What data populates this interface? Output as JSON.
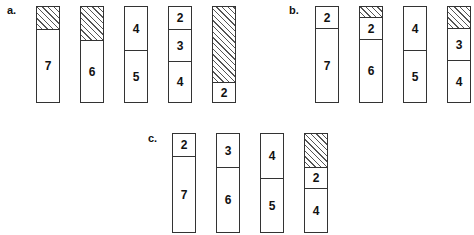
{
  "panels": [
    {
      "label": "a.",
      "label_pos": [
        7,
        5
      ],
      "bin_top": 6,
      "bin_height": 95,
      "bins": [
        {
          "x": 36,
          "segments": [
            {
              "type": "waste",
              "h": 22
            },
            {
              "type": "item",
              "value": "7",
              "h": 73
            }
          ]
        },
        {
          "x": 80,
          "segments": [
            {
              "type": "waste",
              "h": 33
            },
            {
              "type": "item",
              "value": "6",
              "h": 62
            }
          ]
        },
        {
          "x": 124,
          "segments": [
            {
              "type": "item",
              "value": "4",
              "h": 43
            },
            {
              "type": "item",
              "value": "5",
              "h": 52
            }
          ]
        },
        {
          "x": 168,
          "segments": [
            {
              "type": "item",
              "value": "2",
              "h": 22
            },
            {
              "type": "item",
              "value": "3",
              "h": 32
            },
            {
              "type": "item",
              "value": "4",
              "h": 41
            }
          ]
        },
        {
          "x": 212,
          "segments": [
            {
              "type": "waste",
              "h": 75
            },
            {
              "type": "item",
              "value": "2",
              "h": 20
            }
          ]
        }
      ]
    },
    {
      "label": "b.",
      "label_pos": [
        289,
        5
      ],
      "bin_top": 6,
      "bin_height": 95,
      "bins": [
        {
          "x": 315,
          "segments": [
            {
              "type": "item",
              "value": "2",
              "h": 21
            },
            {
              "type": "item",
              "value": "7",
              "h": 74
            }
          ]
        },
        {
          "x": 359,
          "segments": [
            {
              "type": "waste",
              "h": 10
            },
            {
              "type": "item",
              "value": "2",
              "h": 22
            },
            {
              "type": "item",
              "value": "6",
              "h": 63
            }
          ]
        },
        {
          "x": 403,
          "segments": [
            {
              "type": "item",
              "value": "4",
              "h": 43
            },
            {
              "type": "item",
              "value": "5",
              "h": 52
            }
          ]
        },
        {
          "x": 447,
          "segments": [
            {
              "type": "waste",
              "h": 21
            },
            {
              "type": "item",
              "value": "3",
              "h": 32
            },
            {
              "type": "item",
              "value": "4",
              "h": 42
            }
          ]
        }
      ]
    },
    {
      "label": "c.",
      "label_pos": [
        148,
        133
      ],
      "bin_top": 133,
      "bin_height": 98,
      "bins": [
        {
          "x": 172,
          "segments": [
            {
              "type": "item",
              "value": "2",
              "h": 22
            },
            {
              "type": "item",
              "value": "7",
              "h": 76
            }
          ]
        },
        {
          "x": 216,
          "segments": [
            {
              "type": "item",
              "value": "3",
              "h": 33
            },
            {
              "type": "item",
              "value": "6",
              "h": 65
            }
          ]
        },
        {
          "x": 260,
          "segments": [
            {
              "type": "item",
              "value": "4",
              "h": 44
            },
            {
              "type": "item",
              "value": "5",
              "h": 54
            }
          ]
        },
        {
          "x": 304,
          "segments": [
            {
              "type": "waste",
              "h": 33
            },
            {
              "type": "item",
              "value": "2",
              "h": 21
            },
            {
              "type": "item",
              "value": "4",
              "h": 44
            }
          ]
        }
      ]
    }
  ]
}
